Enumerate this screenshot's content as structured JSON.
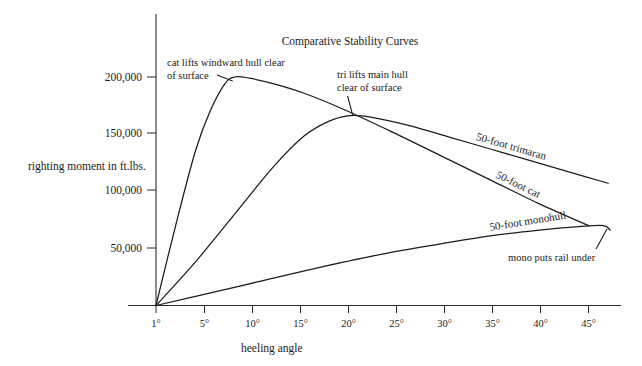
{
  "chart_data": {
    "type": "line",
    "title": "Comparative Stability Curves",
    "xlabel": "heeling angle",
    "ylabel": "righting moment in ft.lbs.",
    "xlim": [
      1,
      47
    ],
    "ylim": [
      0,
      225000
    ],
    "grid": false,
    "legend_position": "inline-along-curves",
    "x_tick_labels": [
      "1°",
      "5°",
      "10°",
      "15°",
      "20°",
      "25°",
      "30°",
      "35°",
      "40°",
      "45°"
    ],
    "x_tick_values": [
      1,
      5,
      10,
      15,
      20,
      25,
      30,
      35,
      40,
      45
    ],
    "y_tick_labels": [
      "50,000",
      "100,000",
      "150,000",
      "200,000"
    ],
    "y_tick_values": [
      50000,
      100000,
      150000,
      200000
    ],
    "series": [
      {
        "name": "50-foot cat",
        "label": "50-foot cat",
        "x": [
          1,
          3,
          5,
          6.5,
          8,
          9,
          10.5,
          13,
          16,
          20,
          25,
          30,
          35,
          40,
          45
        ],
        "values": [
          0,
          70000,
          135000,
          170000,
          194000,
          200000,
          199000,
          194000,
          186000,
          172000,
          152000,
          131000,
          110000,
          89000,
          70000
        ]
      },
      {
        "name": "50-foot trimaran",
        "label": "50-foot trimaran",
        "x": [
          1,
          5,
          9,
          13,
          16,
          18.5,
          20.5,
          22,
          24,
          27,
          31,
          35,
          39,
          43,
          47
        ],
        "values": [
          0,
          38000,
          80000,
          122000,
          148000,
          161000,
          166000,
          166000,
          163000,
          157000,
          147000,
          137000,
          127000,
          117000,
          107000
        ]
      },
      {
        "name": "50-foot monohull",
        "label": "50-foot monohull",
        "x": [
          1,
          6,
          12,
          18,
          24,
          30,
          35,
          40,
          44,
          46.5,
          47.2
        ],
        "values": [
          0,
          10000,
          22000,
          34000,
          45000,
          54000,
          61000,
          66000,
          69000,
          70000,
          66000
        ]
      }
    ],
    "annotations": [
      {
        "id": "cat-annotation",
        "text_line1": "cat lifts windward hull clear",
        "text_line2": "of surface",
        "points_to_series": "50-foot cat"
      },
      {
        "id": "tri-annotation",
        "text_line1": "tri lifts main hull",
        "text_line2": "clear of  surface",
        "points_to_series": "50-foot trimaran"
      },
      {
        "id": "mono-annotation",
        "text_line1": "mono puts rail under",
        "text_line2": "",
        "points_to_series": "50-foot monohull"
      }
    ]
  },
  "colors": {
    "ink": "#1a1a1a",
    "axis": "#2b2b2b",
    "background": "#ffffff"
  }
}
